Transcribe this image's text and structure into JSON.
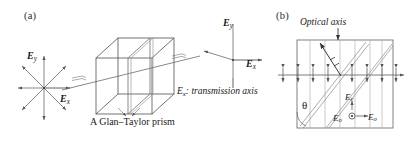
{
  "figure": {
    "background": "#ffffff",
    "stroke": "#4d4d4d",
    "panels": [
      {
        "id": "a",
        "label": "(a)"
      },
      {
        "id": "b",
        "label": "(b)"
      }
    ]
  },
  "panel_a": {
    "label": "(a)",
    "input_beam": {
      "description": "unpolarized-light-star",
      "axis_labels": {
        "vertical": "E",
        "vertical_sub": "y",
        "horizontal": "E",
        "horizontal_sub": "x"
      },
      "ray_count": 8
    },
    "device": {
      "name": "A Glan–Taylor prism",
      "shape": "cube-with-diagonal-interface"
    },
    "output_beam": {
      "axis_labels": {
        "vertical": "E",
        "vertical_sub": "y",
        "horizontal": "E",
        "horizontal_sub": "x"
      },
      "polarization": "horizontal"
    },
    "transmission_note": {
      "symbol": "E",
      "symbol_sub": "x",
      "text": ": transmission axis"
    }
  },
  "panel_b": {
    "label": "(b)",
    "optical_axis_label": "Optical axis",
    "angle_label": "θ",
    "crystal": {
      "description": "birefringent-slab-with-tilted-optical-axis"
    },
    "field_labels": {
      "extraordinary": {
        "symbol": "E",
        "sub": "e"
      },
      "ordinary_dot": {
        "symbol": "E",
        "sub": "o"
      },
      "ordinary_arrow": {
        "symbol": "E",
        "sub": "o"
      }
    },
    "ray_markers": {
      "type": "double-headed-vertical-arrows",
      "count": 8
    }
  }
}
